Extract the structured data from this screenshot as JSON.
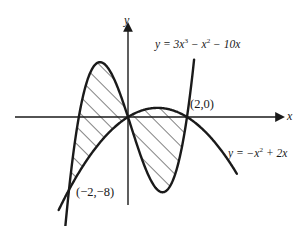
{
  "figure": {
    "background": "#ffffff",
    "stroke_color": "#1a1a1a",
    "hatch_color": "#1a1a1a"
  },
  "axes": {
    "x_label": "x",
    "y_label": "y",
    "origin_px": [
      128,
      117
    ],
    "x_unit_px": 29.5,
    "y_unit_px": 9.1
  },
  "labels": {
    "cubic_equation_parts": {
      "lhs": "y = 3x",
      "exp1": "3",
      "mid": " − x",
      "exp2": "2",
      "tail": " − 10x"
    },
    "parabola_equation_parts": {
      "lhs": "y = −x",
      "exp1": "2",
      "tail": " + 2x"
    },
    "cubic_equation": "y = 3x³ − x² − 10x",
    "parabola_equation": "y = −x² + 2x",
    "point_right": "(2,0)",
    "point_left": "(−2,−8)"
  },
  "chart_data": {
    "type": "line",
    "title": "",
    "xlabel": "x",
    "ylabel": "y",
    "xlim": [
      -3.9,
      5.4
    ],
    "ylim": [
      -12.6,
      12.6
    ],
    "grid": false,
    "legend": "inline-curve-labels",
    "series": [
      {
        "name": "y = 3x³ − x² − 10x",
        "expression": "3*x**3 - x**2 - 10*x",
        "x_domain": [
          -2.32,
          2.25
        ],
        "points": [
          [
            -2.32,
            -8.72
          ],
          [
            -2.2,
            -5.34
          ],
          [
            -2.1,
            -2.69
          ],
          [
            -2.0,
            -8e-15
          ],
          [
            -1.9,
            2.47
          ],
          [
            -1.8,
            4.75
          ],
          [
            -1.7,
            6.79
          ],
          [
            -1.6,
            8.58
          ],
          [
            -1.5,
            10.12
          ],
          [
            -1.4,
            11.4
          ],
          [
            -1.3,
            12.42
          ],
          [
            -1.2,
            13.18
          ],
          [
            -1.1,
            13.68
          ],
          [
            -1.0,
            13.9
          ],
          [
            -0.9,
            13.85
          ],
          [
            -0.8,
            13.54
          ],
          [
            -0.7,
            12.96
          ],
          [
            -0.6,
            12.11
          ],
          [
            -0.5,
            11.0
          ],
          [
            -0.4,
            9.63
          ],
          [
            -0.3,
            8.0
          ],
          [
            -0.2,
            6.12
          ],
          [
            -0.1,
            4.0
          ],
          [
            0.0,
            0.0
          ],
          [
            0.1,
            -1.01
          ],
          [
            0.2,
            -2.02
          ],
          [
            0.3,
            -2.96
          ],
          [
            0.4,
            -3.84
          ],
          [
            0.5,
            -4.63
          ],
          [
            0.6,
            -5.28
          ],
          [
            0.7,
            -5.76
          ],
          [
            0.8,
            -6.02
          ],
          [
            0.9,
            -6.02
          ],
          [
            1.0,
            -5.71
          ],
          [
            1.1,
            -5.04
          ],
          [
            1.2,
            -3.96
          ],
          [
            1.3,
            -2.42
          ],
          [
            1.4,
            -0.36
          ],
          [
            1.5,
            2.25
          ],
          [
            1.6,
            5.5
          ],
          [
            1.7,
            9.45
          ],
          [
            1.8,
            14.16
          ],
          [
            1.9,
            19.67
          ],
          [
            2.0,
            0.0
          ],
          [
            2.1,
            33.32
          ],
          [
            2.2,
            41.38
          ],
          [
            2.25,
            45.75
          ]
        ],
        "note": "cubic; zeros at x=-2 (shared with parabola), x=0, x=2"
      },
      {
        "name": "y = −x² + 2x",
        "expression": "-x**2 + 2*x",
        "x_domain": [
          -2.35,
          3.7
        ],
        "points": [
          [
            -2.35,
            -10.22
          ],
          [
            -2.2,
            -9.24
          ],
          [
            -2.0,
            -8.0
          ],
          [
            -1.8,
            -6.84
          ],
          [
            -1.6,
            -5.76
          ],
          [
            -1.4,
            -4.76
          ],
          [
            -1.2,
            -3.84
          ],
          [
            -1.0,
            -3.0
          ],
          [
            -0.8,
            -2.24
          ],
          [
            -0.6,
            -1.56
          ],
          [
            -0.4,
            -0.96
          ],
          [
            -0.2,
            -0.44
          ],
          [
            0.0,
            0.0
          ],
          [
            0.2,
            0.36
          ],
          [
            0.4,
            0.64
          ],
          [
            0.6,
            0.84
          ],
          [
            0.8,
            0.96
          ],
          [
            1.0,
            1.0
          ],
          [
            1.2,
            0.96
          ],
          [
            1.4,
            0.84
          ],
          [
            1.6,
            0.64
          ],
          [
            1.8,
            0.36
          ],
          [
            2.0,
            0.0
          ],
          [
            2.2,
            -0.44
          ],
          [
            2.4,
            -0.96
          ],
          [
            2.6,
            -1.56
          ],
          [
            2.8,
            -2.24
          ],
          [
            3.0,
            -3.0
          ],
          [
            3.2,
            -3.84
          ],
          [
            3.4,
            -4.76
          ],
          [
            3.7,
            -6.29
          ]
        ],
        "note": "downward parabola; vertex (1,1); zeros at x=0 and x=2"
      }
    ],
    "intersections": [
      {
        "label": "(−2,−8)",
        "x": -2,
        "y": -8
      },
      {
        "label": "",
        "x": 0,
        "y": 0
      },
      {
        "label": "(2,0)",
        "x": 2,
        "y": 0
      }
    ],
    "shaded_regions": [
      {
        "name": "left-region",
        "x_from": -2,
        "x_to": 0,
        "upper_curve": "y = 3x³ − x² − 10x",
        "lower_curve": "y = −x² + 2x",
        "fill": "diagonal-hatch"
      },
      {
        "name": "right-region",
        "x_from": 0,
        "x_to": 2,
        "upper_curve": "y = −x² + 2x",
        "lower_curve": "y = 3x³ − x² − 10x",
        "fill": "diagonal-hatch"
      }
    ]
  }
}
